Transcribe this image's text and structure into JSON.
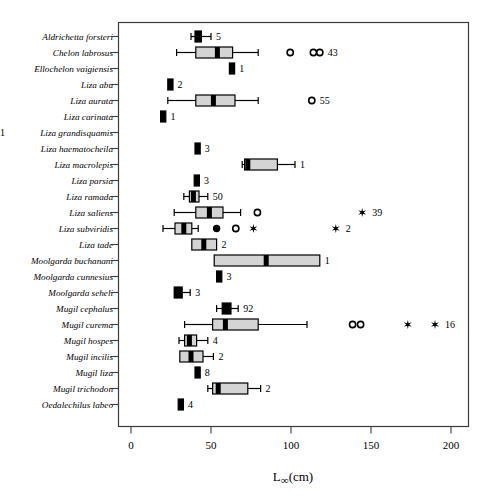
{
  "chart_data": {
    "type": "box",
    "title": "",
    "xlabel": "L∞(cm)",
    "ylabel": "",
    "xlim": [
      0,
      210
    ],
    "xticks": [
      0,
      50,
      100,
      150,
      200
    ],
    "xticklabels": [
      "0",
      "50",
      "100",
      "150",
      "200"
    ],
    "grid": false,
    "legend": null,
    "note": "Horizontal box-and-whisker plot of asymptotic length L-infinity (cm) per mullet species. Number at right of each row is the sample size n. Open circles = mild outliers, filled circles = outliers, asterisks = extreme outliers.",
    "categories": [
      "Aldrichetta forsteri",
      "Chelon labrosus",
      "Ellochelon vaigiensis",
      "Liza abu",
      "Liza aurata",
      "Liza carinata",
      "Liza grandisquamis",
      "Liza haematocheila",
      "Liza macrolepis",
      "Liza parsia",
      "Liza ramada",
      "Liza saliens",
      "Liza subviridis",
      "Liza tade",
      "Moolgarda buchanani",
      "Moolgarda cunnesius",
      "Moolgarda seheli",
      "Mugil cephalus",
      "Mugil curema",
      "Mugil hospes",
      "Mugil incilis",
      "Mugil liza",
      "Mugil trichodon",
      "Oedalechilus labeo"
    ],
    "boxes": [
      {
        "species": "Aldrichetta forsteri",
        "n": "5",
        "whisker_low": 37.5,
        "q1": 40.0,
        "median": 42.0,
        "q3": 44.0,
        "whisker_high": 50.0,
        "outliers_open": [],
        "outliers_filled": [],
        "outliers_star": []
      },
      {
        "species": "Chelon labrosus",
        "n": "43",
        "whisker_low": 28.5,
        "q1": 40.5,
        "median": 54.0,
        "q3": 63.5,
        "whisker_high": 79.5,
        "outliers_open": [
          99.5,
          114.0,
          118.0
        ],
        "outliers_filled": [],
        "outliers_star": []
      },
      {
        "species": "Ellochelon vaigiensis",
        "n": "1",
        "whisker_low": null,
        "q1": 61.5,
        "median": 63.0,
        "q3": 64.5,
        "whisker_high": null,
        "outliers_open": [],
        "outliers_filled": [],
        "outliers_star": []
      },
      {
        "species": "Liza abu",
        "n": "2",
        "whisker_low": null,
        "q1": 23.0,
        "median": 24.5,
        "q3": 26.0,
        "whisker_high": null,
        "outliers_open": [],
        "outliers_filled": [],
        "outliers_star": []
      },
      {
        "species": "Liza aurata",
        "n": "55",
        "whisker_low": 23.0,
        "q1": 40.5,
        "median": 51.5,
        "q3": 65.0,
        "whisker_high": 79.5,
        "outliers_open": [
          113.0
        ],
        "outliers_filled": [],
        "outliers_star": []
      },
      {
        "species": "Liza carinata",
        "n": "1",
        "whisker_low": null,
        "q1": 18.5,
        "median": 20.0,
        "q3": 21.5,
        "whisker_high": null,
        "outliers_open": [],
        "outliers_filled": [],
        "outliers_star": []
      },
      {
        "species": "Liza grandisquamis",
        "n": "",
        "whisker_low": null,
        "q1": null,
        "median": null,
        "q3": null,
        "whisker_high": null,
        "outliers_open": [],
        "outliers_filled": [],
        "outliers_star": []
      },
      {
        "species": "Liza haematocheila",
        "n": "1",
        "whisker_low": null,
        "q1": 40.0,
        "median": 41.5,
        "q3": 43.0,
        "whisker_high": null,
        "outliers_open": [],
        "outliers_filled": [],
        "outliers_star": []
      },
      {
        "species": "Liza macrolepis",
        "n": "3",
        "whisker_low": 69.5,
        "q1": 71.0,
        "median": 73.0,
        "q3": 91.5,
        "whisker_high": 102.5,
        "outliers_open": [],
        "outliers_filled": [],
        "outliers_star": []
      },
      {
        "species": "Liza parsia",
        "n": "1",
        "whisker_low": null,
        "q1": 39.5,
        "median": 41.0,
        "q3": 42.5,
        "whisker_high": null,
        "outliers_open": [],
        "outliers_filled": [],
        "outliers_star": []
      },
      {
        "species": "Liza ramada",
        "n": "3",
        "whisker_low": 33.0,
        "q1": 36.5,
        "median": 39.0,
        "q3": 42.5,
        "whisker_high": 48.0,
        "outliers_open": [],
        "outliers_filled": [],
        "outliers_star": []
      },
      {
        "species": "Liza saliens",
        "n": "50",
        "whisker_low": 27.0,
        "q1": 40.5,
        "median": 49.0,
        "q3": 57.5,
        "whisker_high": 68.5,
        "outliers_open": [
          79.0
        ],
        "outliers_filled": [],
        "outliers_star": [
          144.5
        ]
      },
      {
        "species": "Liza subviridis",
        "n": "39",
        "whisker_low": 20.0,
        "q1": 27.5,
        "median": 33.0,
        "q3": 38.0,
        "whisker_high": 42.0,
        "outliers_open": [
          65.5
        ],
        "outliers_filled": [
          53.5
        ],
        "outliers_star": [
          76.5,
          128.0
        ]
      },
      {
        "species": "Liza tade",
        "n": "2",
        "whisker_low": null,
        "q1": 38.0,
        "median": 45.5,
        "q3": 53.5,
        "whisker_high": null,
        "outliers_open": [],
        "outliers_filled": [],
        "outliers_star": []
      },
      {
        "species": "Moolgarda buchanani",
        "n": "2",
        "whisker_low": null,
        "q1": 52.0,
        "median": 84.5,
        "q3": 118.0,
        "whisker_high": null,
        "outliers_open": [],
        "outliers_filled": [],
        "outliers_star": []
      },
      {
        "species": "Moolgarda cunnesius",
        "n": "1",
        "whisker_low": null,
        "q1": 53.5,
        "median": 55.0,
        "q3": 56.5,
        "whisker_high": null,
        "outliers_open": [],
        "outliers_filled": [],
        "outliers_star": []
      },
      {
        "species": "Moolgarda seheli",
        "n": "3",
        "whisker_low": null,
        "q1": 27.0,
        "median": 29.5,
        "q3": 32.0,
        "whisker_high": 37.0,
        "outliers_open": [],
        "outliers_filled": [],
        "outliers_star": []
      },
      {
        "species": "Mugil cephalus",
        "n": "3",
        "whisker_low": 53.5,
        "q1": 57.0,
        "median": 59.5,
        "q3": 62.5,
        "whisker_high": 67.0,
        "outliers_open": [],
        "outliers_filled": [],
        "outliers_star": []
      },
      {
        "species": "Mugil curema",
        "n": "92",
        "whisker_low": 33.5,
        "q1": 51.0,
        "median": 59.0,
        "q3": 79.5,
        "whisker_high": 110.0,
        "outliers_open": [
          138.5,
          143.5
        ],
        "outliers_filled": [],
        "outliers_star": [
          173.0,
          190.0
        ]
      },
      {
        "species": "Mugil hospes",
        "n": "16",
        "whisker_low": 30.0,
        "q1": 33.5,
        "median": 36.5,
        "q3": 41.0,
        "whisker_high": 48.0,
        "outliers_open": [],
        "outliers_filled": [],
        "outliers_star": []
      },
      {
        "species": "Mugil incilis",
        "n": "4",
        "whisker_low": null,
        "q1": 30.5,
        "median": 37.5,
        "q3": 45.0,
        "whisker_high": 51.5,
        "outliers_open": [],
        "outliers_filled": [],
        "outliers_star": []
      },
      {
        "species": "Mugil liza",
        "n": "2",
        "whisker_low": null,
        "q1": 40.0,
        "median": 41.5,
        "q3": 43.0,
        "whisker_high": null,
        "outliers_open": [],
        "outliers_filled": [],
        "outliers_star": []
      },
      {
        "species": "Mugil trichodon",
        "n": "8",
        "whisker_low": 48.0,
        "q1": 51.0,
        "median": 54.5,
        "q3": 73.0,
        "whisker_high": 81.0,
        "outliers_open": [],
        "outliers_filled": [],
        "outliers_star": []
      },
      {
        "species": "Oedalechilus labeo",
        "n": "2",
        "whisker_low": null,
        "q1": 29.5,
        "median": 31.0,
        "q3": 32.5,
        "whisker_high": null,
        "outliers_open": [],
        "outliers_filled": [],
        "outliers_star": []
      }
    ],
    "rows": [
      {
        "label": "Aldrichetta forsteri",
        "n": "5"
      },
      {
        "label": "Chelon labrosus",
        "n": "43"
      },
      {
        "label": "Ellochelon vaigiensis",
        "n": "1"
      },
      {
        "label": "Liza abu",
        "n": "2"
      },
      {
        "label": "Liza aurata",
        "n": "55"
      },
      {
        "label": "Liza carinata",
        "n": "1"
      },
      {
        "label": "Liza grandisquamis",
        "n": "1"
      },
      {
        "label": "Liza haematocheila",
        "n": "3"
      },
      {
        "label": "Liza macrolepis",
        "n": "1"
      },
      {
        "label": "Liza parsia",
        "n": "3"
      },
      {
        "label": "Liza ramada",
        "n": "50"
      },
      {
        "label": "Liza saliens",
        "n": "39"
      },
      {
        "label": "Liza subviridis",
        "n": "2"
      },
      {
        "label": "Liza tade",
        "n": "2"
      },
      {
        "label": "Moolgarda buchanani",
        "n": "1"
      },
      {
        "label": "Moolgarda cunnesius",
        "n": "3"
      },
      {
        "label": "Moolgarda seheli",
        "n": "3"
      },
      {
        "label": "Mugil cephalus",
        "n": "92"
      },
      {
        "label": "Mugil curema",
        "n": "16"
      },
      {
        "label": "Mugil hospes",
        "n": "4"
      },
      {
        "label": "Mugil incilis",
        "n": "2"
      },
      {
        "label": "Mugil liza",
        "n": "8"
      },
      {
        "label": "Mugil trichodon",
        "n": "2"
      },
      {
        "label": "Oedalechilus labeo",
        "n": "4"
      }
    ]
  },
  "axis": {
    "x_title": "L∞(cm)",
    "x_title_base": "L",
    "x_title_sub": "∞",
    "x_title_unit": "(cm)",
    "tick_labels": [
      "0",
      "50",
      "100",
      "150",
      "200"
    ]
  },
  "colors": {
    "box_fill": "#d4d4d4",
    "stroke": "#000000",
    "frame": "#3b3b3b",
    "background": "#ffffff"
  }
}
